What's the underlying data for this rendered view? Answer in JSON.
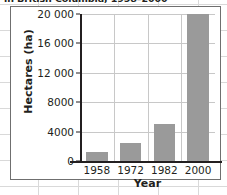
{
  "title": "in British Columbia, 1958–2000",
  "chart_data": {
    "type": "bar",
    "title": "in British Columbia, 1958–2000",
    "xlabel": "Year",
    "ylabel": "Hectares (ha)",
    "categories": [
      "1958",
      "1972",
      "1982",
      "2000"
    ],
    "values": [
      1200,
      2400,
      5000,
      20000
    ],
    "ylim": [
      0,
      20000
    ],
    "yticks": [
      0,
      4000,
      8000,
      12000,
      16000,
      20000
    ],
    "ytick_labels": [
      "0",
      "4000",
      "8000",
      "12 000",
      "16 000",
      "20 000"
    ],
    "grid": true,
    "legend": "none",
    "bar_color": "#9a9a9a",
    "axis_color": "#231f20",
    "gridline_color": "#c8c8c8"
  }
}
